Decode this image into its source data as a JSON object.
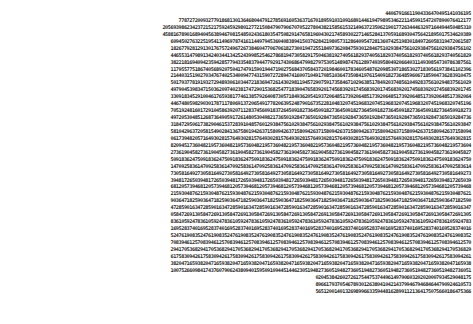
{
  "document": {
    "type": "random-digit-table",
    "lines": [
      "44067916611904336470495141036195",
      "7787272009327791868130136468044791278569160536371670189591031091689144619479895346221145991547207890076412177",
      "2056939862342372152175924592980127721508479079067070522780438215856153214963723506219017726344463297164494450485310",
      "4588167890168940456389467081548502436180354750829147658196043021745893022714652841370591689304756421895017534620389",
      "6094502763225195411496978741611449794536040838941503762842198057312864095472813607425198301849726058319472061587",
      "1826779281291301767572496726738460477067061827300194725518497362084759301284675102938475610293847561029384756102",
      "4465531479891342403441342524399852546278681947305829175046381927405618293740561829374056182937405618293740561829",
      "3822181694094235942857794335483794477929174306864799827975305148987476128974939580492066403114930854730786387561",
      "1179557751867405689207504174791590194471902756843705843720198460017834605487620985307186530271830561973841102396",
      "2144031519027034767402534009477431590727289474160071049170851036473508419761540918273648596067185904736283910475",
      "5017937781919327294893061034472183694726143029811945729075917358467102963851784920374856104928375610294837561029",
      "4979045398347150362097402381747290153682547718390476583920174568392017456839201745683920174568392017456839201745",
      "3309183452910046176593817746138579264087305718493620541937206485173920648517392064851739206485173920648517392064",
      "4467480598290301787117806913720654917782063952487901673522810483207451968320745196832074519683207451968320745196",
      "7051924816017291045863920711283745609183726450918273645091827364509182736450918273645091827364509182736450918273",
      "4972053048512687364905917261480530498217365019284736501928473650192847365019284736501928473650192847365019284736",
      "3184729506173829046153728391048576012938475610293847561029384756102938475610293847561029384756102938475610293847",
      "5810429637205815490284136758019426371580942637158094263715809426371580942637158094263715809426371580942637158094",
      "0617394820571649302815764930281576493028157649302815764930281576493028157649302815764930281576493028157649302815",
      "8209451736048219573604821957360482195736048219573604821957360482195736048219573604821957360482195736048219573604",
      "2736190458273619045827361904582736190458273619045827361904582736190458273619045827361904582736190458273619045827",
      "5091836247509183624750918362475091836247509183624750918362475091836247509183624750918362475091836247509183624750",
      "1470925836147092583614709258361470925836147092583614709258361470925836147092583614709258361470925836147092583614",
      "7305816492730581649273058164927305816492730581649273058164927305816492730581649273058164927305816492730581649273",
      "3948172650394817265039481726503948172650394817265039481726503948172650394817265039481726503948172650394817265039",
      "6812057394681205739468120573946812057394681205739468120573946812057394681205739468120573946812057394681205739468",
      "2159304876215930487621593048762159304876215930487621593048762159304876215930487621593048762159304876215930487621",
      "9036471825903647182590364718259036471825903647182590364718259036471825903647182590364718259036471825903647182590",
      "4728590163472859016347285901634728590163472859016347285901634728590163472859016347285901634728590163472859016347",
      "0584726913058472691305847269130584726913058472691305847269130584726913058472691305847269130584726913058472691305",
      "8361059247836105924783610592478361059247836105924783610592478361059247836105924783610592478361059247836105924783",
      "1695283740169528374016952837401695283740169528374016952837401695283740169528374016952837401695283740169528374016",
      "5247619083524761908352476190835247619083524761908352476190835247619083524761908352476190835247619083524761908352",
      "7083946125708394612570839461257083946125708394612570839461257083946125708394612570839461257083946125708394612570",
      "2941705368294170536829417053682941705368294170536829417053682941705368294170536829417053682941705368294170536829",
      "6175830942617583094261758309426175830942617583094261758309426175830942617583094261758309426175830942617583094261",
      "3820471659382047165938204716593820471659382047165938204716593820471659382047165938204716593820471659382047165938",
      "1007526609841743760790624380940159509109445144623051948273605194827360519482736051948273605194827360519482736051",
      "0204538426027261754475374496149790603202020007934529048175",
      "8966179370546789301263804104214379946794684644790924610573",
      "5651200140132698996633594481628991121364175075660186475366"
    ]
  }
}
